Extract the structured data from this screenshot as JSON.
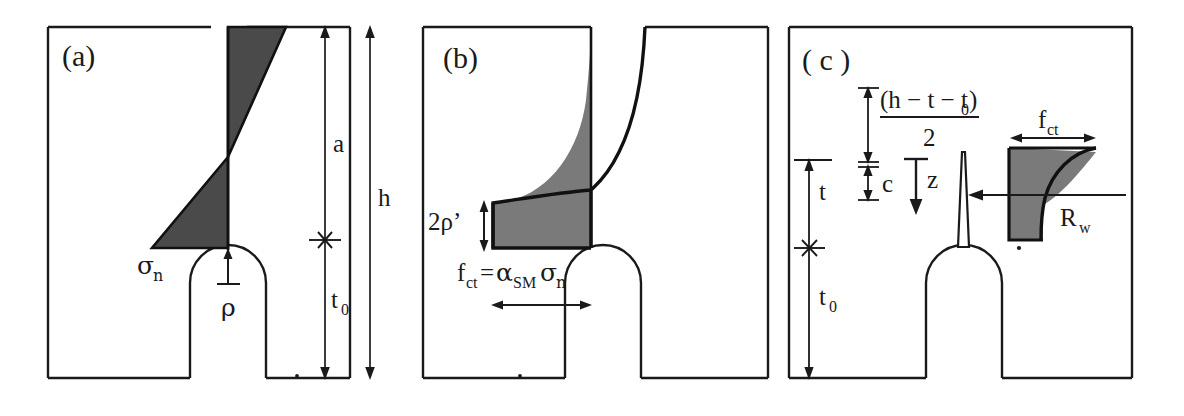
{
  "figure": {
    "kind": "three-panel-mechanics-diagram",
    "background_color": "#ffffff",
    "ink_color": "#1a1a1a",
    "shade_dark": "#4a4a4a",
    "shade_light": "#7a7a7a"
  },
  "panels": [
    {
      "id": "a",
      "label": "(a)",
      "description": "notched specimen with bi-linear normal stress distribution",
      "labels": {
        "stress": "σ",
        "stress_sub": "n",
        "notch_radius": "ρ",
        "dim_a": "a",
        "dim_h": "h",
        "dim_t0": "t",
        "dim_t0_sub": "0"
      }
    },
    {
      "id": "b",
      "label": "(b)",
      "description": "notched specimen with non-linear tensile strength distribution",
      "labels": {
        "two_rho_prime": "2ρ’",
        "fct": "f",
        "fct_sub": "ct",
        "equals": "=",
        "alpha": "α",
        "alpha_sub": "SM",
        "sigma": "σ",
        "sigma_sub": "n"
      }
    },
    {
      "id": "c",
      "label": "( c )",
      "description": "cracked specimen with cohesive stress block and geometric dimensions",
      "labels": {
        "frac_numerator": "(h − t − t",
        "frac_numerator_sub": "0",
        "frac_numerator_close": ")",
        "frac_denominator": "2",
        "dim_c": "c",
        "dim_z": "z",
        "dim_t": "t",
        "dim_t0": "t",
        "dim_t0_sub": "0",
        "fct": "f",
        "fct_sub": "ct",
        "rw": "R",
        "rw_sub": "w"
      }
    }
  ]
}
